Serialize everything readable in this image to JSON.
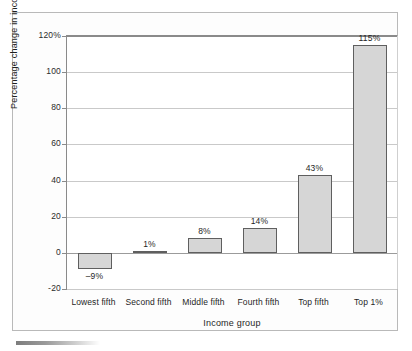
{
  "chart_data": {
    "type": "bar",
    "title": "",
    "xlabel": "Income group",
    "ylabel": "Percentage change in income",
    "categories": [
      "Lowest fifth",
      "Second fifth",
      "Middle fifth",
      "Fourth fifth",
      "Top fifth",
      "Top 1%"
    ],
    "values": [
      -9,
      1,
      8,
      14,
      43,
      115
    ],
    "value_labels": [
      "–9%",
      "1%",
      "8%",
      "14%",
      "43%",
      "115%"
    ],
    "ylim": [
      -20,
      120
    ],
    "yticks": [
      -20,
      0,
      20,
      40,
      60,
      80,
      100,
      120
    ],
    "ytick_labels": [
      "-20",
      "0",
      "20",
      "40",
      "60",
      "80",
      "100",
      "120%"
    ],
    "grid": true,
    "legend": "none",
    "series": [
      {
        "name": "Percentage change in income",
        "values": [
          -9,
          1,
          8,
          14,
          43,
          115
        ]
      }
    ],
    "colors": {
      "bar_fill": "#d6d6d6",
      "bar_border": "#5f5f5f",
      "gridline": "#c9c9c9",
      "axis": "#8a8a8a",
      "text": "#1f1f1f"
    }
  }
}
